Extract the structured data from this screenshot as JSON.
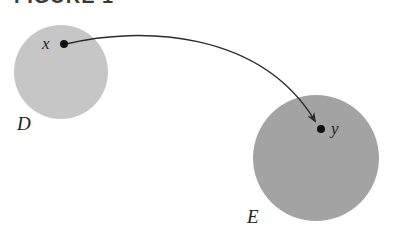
{
  "figure": {
    "title": "FIGURE 1"
  },
  "sets": [
    {
      "name": "D",
      "color": "#c6c6c6",
      "cx": 61,
      "cy": 72,
      "r": 47,
      "label_x": 17,
      "label_y": 130
    },
    {
      "name": "E",
      "color": "#a3a3a3",
      "cx": 316,
      "cy": 158,
      "r": 63,
      "label_x": 247,
      "label_y": 223
    }
  ],
  "points": [
    {
      "name": "x",
      "cx": 64,
      "cy": 44,
      "label_x": 42,
      "label_y": 49
    },
    {
      "name": "y",
      "cx": 321,
      "cy": 129,
      "label_x": 331,
      "label_y": 134
    }
  ],
  "arrow": {
    "from": "x",
    "to": "y",
    "color": "#2a2a2a"
  }
}
